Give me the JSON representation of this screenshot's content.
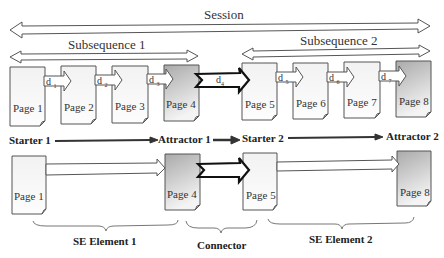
{
  "diagram": {
    "session_label": "Session",
    "subsequences": [
      {
        "label": "Subsequence 1"
      },
      {
        "label": "Subsequence 2"
      }
    ],
    "top_row_pages": [
      {
        "label": "Page 1",
        "shaded": false
      },
      {
        "label": "Page 2",
        "shaded": false
      },
      {
        "label": "Page 3",
        "shaded": false
      },
      {
        "label": "Page 4",
        "shaded": true
      },
      {
        "label": "Page 5",
        "shaded": false
      },
      {
        "label": "Page 6",
        "shaded": false
      },
      {
        "label": "Page 7",
        "shaded": false
      },
      {
        "label": "Page 8",
        "shaded": true
      }
    ],
    "transitions": [
      {
        "label": "d",
        "sub": "1"
      },
      {
        "label": "d",
        "sub": "2"
      },
      {
        "label": "d",
        "sub": "3"
      },
      {
        "label": "d",
        "sub": "4",
        "bold": true
      },
      {
        "label": "d",
        "sub": "5"
      },
      {
        "label": "d",
        "sub": "6"
      },
      {
        "label": "d",
        "sub": "7"
      }
    ],
    "roles": [
      {
        "label": "Starter 1"
      },
      {
        "label": "Attractor 1"
      },
      {
        "label": "Starter 2"
      },
      {
        "label": "Attractor 2"
      }
    ],
    "bottom_row_pages": [
      {
        "label": "Page 1",
        "shaded": false
      },
      {
        "label": "Page 4",
        "shaded": true
      },
      {
        "label": "Page 5",
        "shaded": false
      },
      {
        "label": "Page 8",
        "shaded": true
      }
    ],
    "braces": [
      {
        "label": "SE Element 1"
      },
      {
        "label": "Connector"
      },
      {
        "label": "SE Element 2"
      }
    ],
    "colors": {
      "line": "#444444",
      "page_fill": "#f6f6f6",
      "page_shaded": "#bdbdbd",
      "bold_arrow": "#111111"
    }
  }
}
